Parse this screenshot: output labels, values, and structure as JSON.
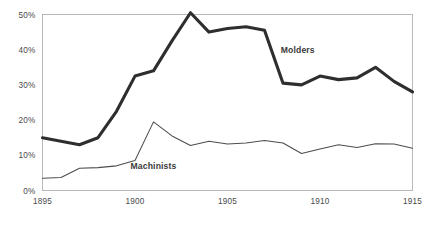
{
  "chart_data": {
    "type": "line",
    "title": "",
    "subtitle": "",
    "xlabel": "",
    "ylabel": "",
    "xlim": [
      1895,
      1915
    ],
    "ylim": [
      0,
      50
    ],
    "grid": false,
    "legend_position": "inline-annotation",
    "x_ticks": [
      1895,
      1900,
      1905,
      1910,
      1915
    ],
    "x_tick_labels": [
      "1895",
      "1900",
      "1905",
      "1910",
      "1915"
    ],
    "y_ticks": [
      0,
      10,
      20,
      30,
      40,
      50
    ],
    "y_tick_labels": [
      "0%",
      "10%",
      "20%",
      "30%",
      "40%",
      "50%"
    ],
    "x": [
      1895,
      1896,
      1897,
      1898,
      1899,
      1900,
      1901,
      1902,
      1903,
      1904,
      1905,
      1906,
      1907,
      1908,
      1909,
      1910,
      1911,
      1912,
      1913,
      1914,
      1915
    ],
    "series": [
      {
        "name": "Molders",
        "label": "Molders",
        "color": "#2e2e2e",
        "line_width": 3.1,
        "label_x": 1908.8,
        "label_y": 39.0,
        "values": [
          15.0,
          14.0,
          13.0,
          15.0,
          22.5,
          32.5,
          34.0,
          42.5,
          50.5,
          45.0,
          46.0,
          46.5,
          45.5,
          30.5,
          30.0,
          32.5,
          31.5,
          32.0,
          35.0,
          31.0,
          28.0
        ]
      },
      {
        "name": "Machinists",
        "label": "Machinists",
        "color": "#4d4d4d",
        "line_width": 1.05,
        "label_x": 1901.0,
        "label_y": 6.2,
        "values": [
          3.5,
          3.7,
          6.3,
          6.5,
          7.0,
          8.5,
          19.5,
          15.5,
          12.8,
          14.0,
          13.2,
          13.5,
          14.2,
          13.5,
          10.5,
          11.8,
          13.0,
          12.2,
          13.3,
          13.2,
          12.0
        ]
      }
    ]
  },
  "figure": {
    "bottom_cut_text": ""
  }
}
